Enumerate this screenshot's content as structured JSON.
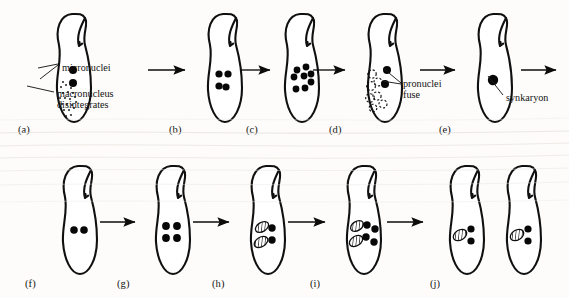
{
  "figure": {
    "background_color": "#fdfcfa",
    "ink_color": "#101010"
  },
  "annotations": [
    {
      "id": "micronuclei",
      "text": "micronuclei",
      "x": 62,
      "y": 62
    },
    {
      "id": "macronucleus",
      "text": "macronucleus\ndisintegrates",
      "x": 57,
      "y": 88
    },
    {
      "id": "pronuclei",
      "text": "pronuclei\nfuse",
      "x": 403,
      "y": 78
    },
    {
      "id": "synkaryon",
      "text": "synkaryon",
      "x": 506,
      "y": 92
    }
  ],
  "panels": [
    {
      "id": "a",
      "label": "(a)",
      "label_x": 18,
      "label_y": 124,
      "cell_x": 52,
      "cell_y": 12
    },
    {
      "id": "b",
      "label": "(b)",
      "label_x": 169,
      "label_y": 124,
      "cell_x": 203,
      "cell_y": 12
    },
    {
      "id": "c",
      "label": "(c)",
      "label_x": 246,
      "label_y": 124,
      "cell_x": 280,
      "cell_y": 12
    },
    {
      "id": "d",
      "label": "(d)",
      "label_x": 329,
      "label_y": 124,
      "cell_x": 363,
      "cell_y": 12
    },
    {
      "id": "e",
      "label": "(e)",
      "label_x": 439,
      "label_y": 124,
      "cell_x": 473,
      "cell_y": 12
    },
    {
      "id": "f",
      "label": "(f)",
      "label_x": 25,
      "label_y": 278,
      "cell_x": 58,
      "cell_y": 164
    },
    {
      "id": "g",
      "label": "(g)",
      "label_x": 117,
      "label_y": 278,
      "cell_x": 151,
      "cell_y": 164
    },
    {
      "id": "h",
      "label": "(h)",
      "label_x": 212,
      "label_y": 278,
      "cell_x": 246,
      "cell_y": 164
    },
    {
      "id": "i",
      "label": "(i)",
      "label_x": 310,
      "label_y": 278,
      "cell_x": 342,
      "cell_y": 164
    },
    {
      "id": "j",
      "label": "(j)",
      "label_x": 430,
      "label_y": 278,
      "cell_x": 445,
      "cell_y": 164
    }
  ],
  "stages": {
    "a": {
      "micronuclei": 2,
      "macronucleus": "stippled-disintegrating",
      "vesicles": 0,
      "hatched_ovals": 0
    },
    "b": {
      "micronuclei": 4,
      "macronucleus": "absent",
      "vesicles": 0,
      "hatched_ovals": 0
    },
    "c": {
      "micronuclei": 8,
      "macronucleus": "absent",
      "vesicles": 0,
      "hatched_ovals": 0
    },
    "d": {
      "micronuclei": 2,
      "macronucleus": "absent",
      "vesicles": 7,
      "hatched_ovals": 0
    },
    "e": {
      "micronuclei": 1,
      "macronucleus": "absent",
      "vesicles": 0,
      "hatched_ovals": 0
    },
    "f": {
      "micronuclei": 2,
      "macronucleus": "absent",
      "vesicles": 0,
      "hatched_ovals": 0
    },
    "g": {
      "micronuclei": 4,
      "macronucleus": "absent",
      "vesicles": 0,
      "hatched_ovals": 0
    },
    "h": {
      "micronuclei": 2,
      "macronucleus": "absent",
      "vesicles": 0,
      "hatched_ovals": 2
    },
    "i": {
      "micronuclei": 4,
      "macronucleus": "absent",
      "vesicles": 0,
      "hatched_ovals": 2
    },
    "j": {
      "micronuclei": 2,
      "macronucleus": "absent",
      "vesicles": 0,
      "hatched_ovals": 1,
      "daughter_cells": 2
    }
  },
  "arrows": [
    {
      "id": "a-to-b",
      "x1": 148,
      "x2": 192,
      "y": 70
    },
    {
      "id": "b-to-c",
      "x1": 240,
      "x2": 277,
      "y": 70
    },
    {
      "id": "c-to-d",
      "x1": 313,
      "x2": 352,
      "y": 70
    },
    {
      "id": "d-to-e",
      "x1": 420,
      "x2": 462,
      "y": 70
    },
    {
      "id": "e-to-f",
      "x1": 521,
      "x2": 563,
      "y": 70
    },
    {
      "id": "f-to-g",
      "x1": 100,
      "x2": 142,
      "y": 222
    },
    {
      "id": "g-to-h",
      "x1": 193,
      "x2": 236,
      "y": 222
    },
    {
      "id": "h-to-i",
      "x1": 288,
      "x2": 332,
      "y": 222
    },
    {
      "id": "i-to-j",
      "x1": 387,
      "x2": 430,
      "y": 222
    }
  ]
}
